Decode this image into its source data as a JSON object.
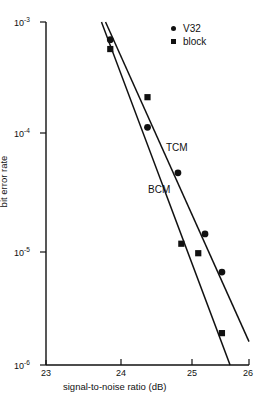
{
  "chart_data": {
    "type": "scatter",
    "title": "",
    "xlabel": "signal-to-noise ratio (dB)",
    "ylabel": "bit error rate",
    "xlim": [
      23,
      26
    ],
    "ylim": [
      1e-06,
      0.001
    ],
    "yscale": "log",
    "xscale": "linear",
    "grid": false,
    "xticks": [
      23,
      24,
      25,
      26
    ],
    "xtick_labels": [
      "23",
      "24",
      "25",
      "26"
    ],
    "yticks": [
      0.001,
      0.0001,
      1e-05,
      1e-06
    ],
    "ytick_labels": [
      "10-3",
      "10-4",
      "10-5",
      "10-6"
    ],
    "ytick_mantissa": [
      "10",
      "10",
      "10",
      "10"
    ],
    "ytick_exponent": [
      "-3",
      "-4",
      "-5",
      "-6"
    ],
    "legend_position": "top-right",
    "series": [
      {
        "name": "V32",
        "marker": "circle",
        "color": "#111111",
        "points": [
          {
            "x": 23.95,
            "y": 0.0007
          },
          {
            "x": 24.5,
            "y": 0.00012
          },
          {
            "x": 24.95,
            "y": 4.8e-05
          },
          {
            "x": 25.35,
            "y": 1.4e-05
          },
          {
            "x": 25.6,
            "y": 6.5e-06
          }
        ]
      },
      {
        "name": "block",
        "marker": "square",
        "color": "#111111",
        "points": [
          {
            "x": 23.95,
            "y": 0.00058
          },
          {
            "x": 24.5,
            "y": 0.00022
          },
          {
            "x": 25.0,
            "y": 1.15e-05
          },
          {
            "x": 25.25,
            "y": 9.5e-06
          },
          {
            "x": 25.6,
            "y": 1.9e-06
          }
        ]
      }
    ],
    "fit_lines": [
      {
        "name": "TCM",
        "label": "TCM",
        "x0": 23.88,
        "y0": 0.001,
        "x1": 26.0,
        "y1": 1.6e-06
      },
      {
        "name": "BCM",
        "label": "BCM",
        "x0": 23.82,
        "y0": 0.001,
        "x1": 25.72,
        "y1": 1e-06
      }
    ],
    "annotations": [
      {
        "text": "TCM",
        "x": 25.0,
        "y": 7.6e-05
      },
      {
        "text": "BCM",
        "x": 24.75,
        "y": 2.6e-05
      }
    ]
  },
  "legend": {
    "entries": [
      {
        "label": "V32",
        "marker": "circle"
      },
      {
        "label": "block",
        "marker": "square"
      }
    ]
  },
  "caption": {
    "text": ""
  }
}
